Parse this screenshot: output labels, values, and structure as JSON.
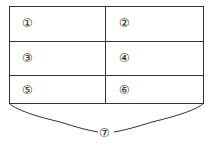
{
  "table": {
    "rows": [
      [
        "①",
        "②"
      ],
      [
        "③",
        "④"
      ],
      [
        "⑤",
        "⑥"
      ]
    ]
  },
  "brace": {
    "label": "⑦"
  },
  "colors": {
    "line": "#333333",
    "background": "#ffffff"
  }
}
